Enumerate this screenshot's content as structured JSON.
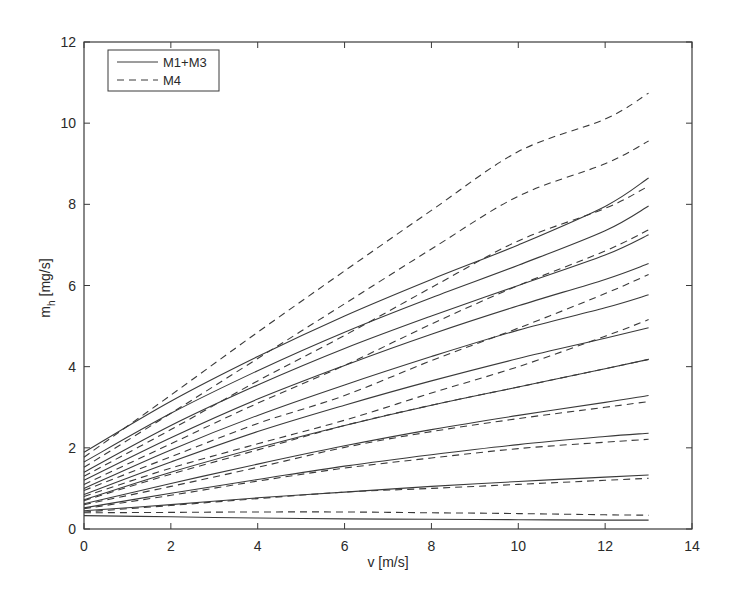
{
  "chart_data": {
    "type": "line",
    "title": "",
    "xlabel": "v [m/s]",
    "ylabel_main": "m",
    "ylabel_sub": "h",
    "ylabel_unit": " [mg/s]",
    "ylabel": "m_h [mg/s]",
    "xlim": [
      0,
      14
    ],
    "ylim": [
      0,
      12
    ],
    "xticks": [
      0,
      2,
      4,
      6,
      8,
      10,
      12,
      14
    ],
    "yticks": [
      0,
      2,
      4,
      6,
      8,
      10,
      12
    ],
    "grid": false,
    "legend_position": "upper left",
    "legend": [
      {
        "label": "M1+M3",
        "style": "solid"
      },
      {
        "label": "M4",
        "style": "dashed"
      }
    ],
    "x": [
      0,
      2,
      4,
      6,
      8,
      10,
      12,
      13
    ],
    "series": [
      {
        "name": "M1+M3",
        "style": "solid",
        "values": [
          1.89,
          3.15,
          4.25,
          5.25,
          6.15,
          7.0,
          7.95,
          8.65
        ]
      },
      {
        "name": "M1+M3",
        "style": "solid",
        "values": [
          1.65,
          2.85,
          3.9,
          4.85,
          5.7,
          6.5,
          7.35,
          7.96
        ]
      },
      {
        "name": "M1+M3",
        "style": "solid",
        "values": [
          1.4,
          2.55,
          3.55,
          4.45,
          5.25,
          6.0,
          6.75,
          7.25
        ]
      },
      {
        "name": "M1+M3",
        "style": "solid",
        "values": [
          1.2,
          2.25,
          3.2,
          4.03,
          4.8,
          5.5,
          6.15,
          6.54
        ]
      },
      {
        "name": "M1+M3",
        "style": "solid",
        "values": [
          1.0,
          1.95,
          2.8,
          3.55,
          4.25,
          4.9,
          5.45,
          5.77
        ]
      },
      {
        "name": "M1+M3",
        "style": "solid",
        "values": [
          0.85,
          1.65,
          2.4,
          3.05,
          3.65,
          4.2,
          4.7,
          4.96
        ]
      },
      {
        "name": "M1+M3",
        "style": "solid",
        "values": [
          0.72,
          1.4,
          2.0,
          2.55,
          3.05,
          3.5,
          3.95,
          4.18
        ]
      },
      {
        "name": "M1+M3",
        "style": "solid",
        "values": [
          0.62,
          1.12,
          1.6,
          2.05,
          2.45,
          2.8,
          3.12,
          3.29
        ]
      },
      {
        "name": "M1+M3",
        "style": "solid",
        "values": [
          0.52,
          0.88,
          1.22,
          1.55,
          1.83,
          2.08,
          2.28,
          2.36
        ]
      },
      {
        "name": "M1+M3",
        "style": "solid",
        "values": [
          0.45,
          0.6,
          0.77,
          0.91,
          1.05,
          1.17,
          1.28,
          1.33
        ]
      },
      {
        "name": "M1+M3",
        "style": "solid",
        "values": [
          0.33,
          0.3,
          0.27,
          0.25,
          0.24,
          0.23,
          0.22,
          0.22
        ]
      },
      {
        "name": "M4",
        "style": "dashed",
        "values": [
          1.77,
          3.3,
          4.85,
          6.36,
          7.85,
          9.3,
          10.1,
          10.74
        ]
      },
      {
        "name": "M4",
        "style": "dashed",
        "values": [
          1.52,
          2.85,
          4.2,
          5.55,
          6.9,
          8.2,
          9.0,
          9.56
        ]
      },
      {
        "name": "M4",
        "style": "dashed",
        "values": [
          1.3,
          2.45,
          3.65,
          4.77,
          5.95,
          7.1,
          7.9,
          8.45
        ]
      },
      {
        "name": "M4",
        "style": "dashed",
        "values": [
          1.1,
          2.1,
          3.1,
          4.03,
          5.05,
          6.0,
          6.85,
          7.37
        ]
      },
      {
        "name": "M4",
        "style": "dashed",
        "values": [
          0.95,
          1.78,
          2.6,
          3.29,
          4.15,
          4.95,
          5.8,
          6.27
        ]
      },
      {
        "name": "M4",
        "style": "dashed",
        "values": [
          0.8,
          1.5,
          2.1,
          2.68,
          3.35,
          4.0,
          4.75,
          5.16
        ]
      },
      {
        "name": "M4",
        "style": "dashed",
        "values": [
          0.7,
          1.35,
          1.95,
          2.55,
          3.05,
          3.5,
          3.95,
          4.18
        ]
      },
      {
        "name": "M4",
        "style": "dashed",
        "values": [
          0.6,
          1.05,
          1.52,
          2.01,
          2.4,
          2.72,
          3.0,
          3.14
        ]
      },
      {
        "name": "M4",
        "style": "dashed",
        "values": [
          0.5,
          0.83,
          1.18,
          1.5,
          1.75,
          1.98,
          2.14,
          2.21
        ]
      },
      {
        "name": "M4",
        "style": "dashed",
        "values": [
          0.42,
          0.58,
          0.75,
          0.91,
          1.0,
          1.1,
          1.2,
          1.25
        ]
      },
      {
        "name": "M4",
        "style": "dashed",
        "values": [
          0.4,
          0.41,
          0.42,
          0.42,
          0.4,
          0.38,
          0.35,
          0.34
        ]
      }
    ]
  },
  "colors": {
    "line": "#3a3a3a",
    "axis": "#3a3a3a",
    "background": "#ffffff"
  }
}
